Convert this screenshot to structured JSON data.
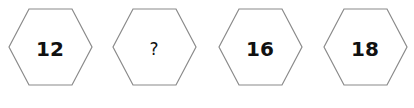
{
  "puzzle": {
    "hexagons": [
      {
        "value": "12"
      },
      {
        "value": "?"
      },
      {
        "value": "16"
      },
      {
        "value": "18"
      }
    ],
    "stroke_color": "#8a8a8a"
  }
}
